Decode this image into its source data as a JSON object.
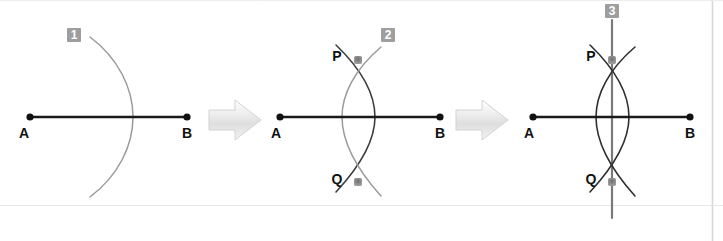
{
  "figure": {
    "width": 723,
    "height": 241,
    "background_color": "#ffffff",
    "border_color": "#d8d8d8"
  },
  "colors": {
    "segment": "#1a1a1a",
    "endpoint_dot": "#111111",
    "arc_from_a": "#9a9a9a",
    "arc_from_b": "#3d3d3d",
    "bisector_line": "#7a7a7a",
    "intersection_dot": "#8c8c8c",
    "label_text": "#111111",
    "badge_fill": "#9e9e9e",
    "badge_text": "#ffffff",
    "arrow_fill": "#e4e4e4",
    "arrow_edge": "#c9c9c9"
  },
  "steps": [
    {
      "badge": "1",
      "badge_x": 73,
      "badge_y": 28,
      "point_a_label": "A",
      "point_b_label": "B",
      "point_a_x": 30,
      "point_b_x": 187,
      "baseline_y": 117,
      "arcs": [
        "arc-from-a"
      ],
      "points": [
        "A",
        "B"
      ],
      "description": "Draw an arc centered at A with radius more than half of AB."
    },
    {
      "badge": "2",
      "badge_x": 387,
      "badge_y": 28,
      "point_a_label": "A",
      "point_b_label": "B",
      "point_p_label": "P",
      "point_q_label": "Q",
      "point_a_x": 280,
      "point_b_x": 440,
      "baseline_y": 117,
      "point_p_x": 358,
      "point_p_y": 60,
      "point_q_x": 358,
      "point_q_y": 182,
      "arcs": [
        "arc-from-a",
        "arc-from-b"
      ],
      "points": [
        "A",
        "B",
        "P",
        "Q"
      ],
      "description": "Draw a second arc centered at B with the same radius; the arcs meet at P and Q."
    },
    {
      "badge": "3",
      "badge_x": 605,
      "badge_y": 4,
      "point_a_label": "A",
      "point_b_label": "B",
      "point_p_label": "P",
      "point_q_label": "Q",
      "point_a_x": 533,
      "point_b_x": 690,
      "baseline_y": 117,
      "point_p_x": 612,
      "point_p_y": 60,
      "point_q_x": 612,
      "point_q_y": 182,
      "arcs": [
        "arc-from-a",
        "arc-from-b"
      ],
      "lines": [
        "perpendicular-bisector-PQ"
      ],
      "points": [
        "A",
        "B",
        "P",
        "Q"
      ],
      "description": "Join P and Q; line PQ is the perpendicular bisector of AB."
    }
  ],
  "arrows": [
    {
      "name": "step-arrow-1-to-2",
      "x": 208,
      "y": 100,
      "width": 52,
      "height": 40
    },
    {
      "name": "step-arrow-2-to-3",
      "x": 455,
      "y": 100,
      "width": 52,
      "height": 40
    }
  ]
}
